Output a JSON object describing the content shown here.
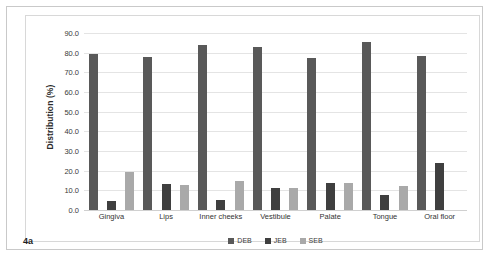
{
  "figure": {
    "panel_label": "4a"
  },
  "chart_data": {
    "type": "bar",
    "title": "",
    "subtitle": "",
    "xlabel": "",
    "ylabel": "Distribution (%)",
    "ylim": [
      0,
      90
    ],
    "ytick_labels": [
      "90.0",
      "80.0",
      "70.0",
      "60.0",
      "50.0",
      "40.0",
      "30.0",
      "20.0",
      "10.0",
      "0.0"
    ],
    "ytick_values": [
      90,
      80,
      70,
      60,
      50,
      40,
      30,
      20,
      10,
      0
    ],
    "grid": true,
    "legend_position": "bottom",
    "categories": [
      "Gingiva",
      "Lips",
      "Inner cheeks",
      "Vestibule",
      "Palate",
      "Tongue",
      "Oral floor"
    ],
    "series": [
      {
        "name": "DEB",
        "color": "#595959",
        "values": [
          79.5,
          77.8,
          84.0,
          82.9,
          77.4,
          85.3,
          78.4
        ]
      },
      {
        "name": "JEB",
        "color": "#3f3f3f",
        "values": [
          4.6,
          13.0,
          4.9,
          11.0,
          13.5,
          7.6,
          24.0
        ]
      },
      {
        "name": "SEB",
        "color": "#a9a9a9",
        "values": [
          19.3,
          12.8,
          15.0,
          11.0,
          13.5,
          12.2,
          0.0
        ]
      }
    ]
  }
}
